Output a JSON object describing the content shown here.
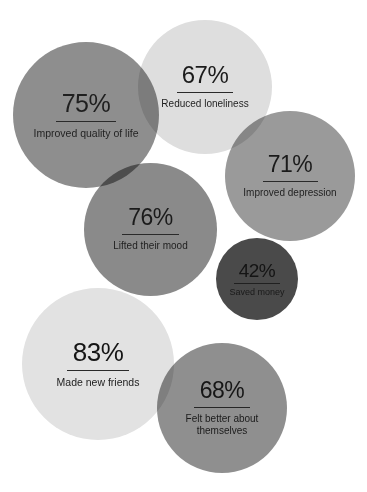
{
  "chart_data": {
    "type": "bubble",
    "title": "",
    "subtitle": "",
    "xlabel": "",
    "ylabel": "",
    "grid": false,
    "legend": false,
    "background_color": "#ffffff",
    "value_suffix": "%",
    "categories": [
      "Improved quality of life",
      "Reduced loneliness",
      "Improved depression",
      "Lifted their mood",
      "Saved money",
      "Made new friends",
      "Felt better about themselves"
    ],
    "values": [
      75,
      67,
      71,
      76,
      42,
      83,
      68
    ],
    "bubbles": [
      {
        "id": "quality-of-life",
        "value": 75,
        "value_text": "75",
        "percent_text": "%",
        "label": "Improved quality of life",
        "color": "#8e8e8e",
        "text_color": "#1f1f1f"
      },
      {
        "id": "reduced-loneliness",
        "value": 67,
        "value_text": "67",
        "percent_text": "%",
        "label": "Reduced loneliness",
        "color": "#dedede",
        "text_color": "#1b1b1b"
      },
      {
        "id": "improved-depression",
        "value": 71,
        "value_text": "71",
        "percent_text": "%",
        "label": "Improved depression",
        "color": "#9a9a9a",
        "text_color": "#1b1b1b"
      },
      {
        "id": "lifted-mood",
        "value": 76,
        "value_text": "76",
        "percent_text": "%",
        "label": "Lifted their mood",
        "color": "#8a8a8a",
        "text_color": "#1b1b1b"
      },
      {
        "id": "saved-money",
        "value": 42,
        "value_text": "42",
        "percent_text": "%",
        "label": "Saved money",
        "color": "#4a4a4a",
        "text_color": "#141414"
      },
      {
        "id": "made-new-friends",
        "value": 83,
        "value_text": "83",
        "percent_text": "%",
        "label": "Made new friends",
        "color": "#e2e2e2",
        "text_color": "#151515"
      },
      {
        "id": "felt-better",
        "value": 68,
        "value_text": "68",
        "percent_text": "%",
        "label": "Felt better about themselves",
        "color": "#8f8f8f",
        "text_color": "#161616"
      }
    ]
  }
}
